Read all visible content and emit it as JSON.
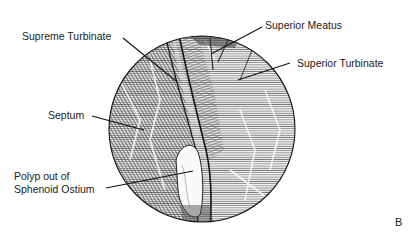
{
  "figure": {
    "panel_letter": "B",
    "view": "endoscopic circular view",
    "labels": {
      "supreme_turbinate": "Supreme Turbinate",
      "superior_meatus": "Superior Meatus",
      "superior_turbinate": "Superior Turbinate",
      "septum": "Septum",
      "polyp_line1": "Polyp out of",
      "polyp_line2": "Sphenoid Ostium"
    },
    "colors": {
      "ink": "#1a1a1a",
      "background": "#ffffff",
      "hatch": "#555555"
    }
  }
}
